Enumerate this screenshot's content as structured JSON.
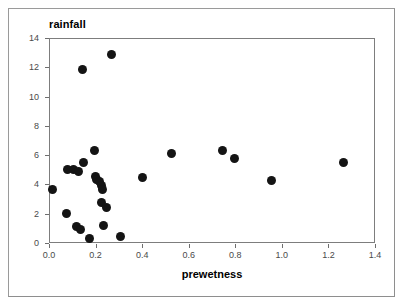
{
  "chart_data": {
    "type": "scatter",
    "title": "rainfall",
    "xlabel": "prewetness",
    "ylabel": "rainfall",
    "xlim": [
      0.0,
      1.4
    ],
    "ylim": [
      0,
      14
    ],
    "grid": false,
    "legend": null,
    "marker": {
      "shape": "circle",
      "filled": true,
      "color": "#141414",
      "size_px": 9
    },
    "xticks": [
      0.0,
      0.2,
      0.4,
      0.6,
      0.8,
      1.0,
      1.2,
      1.4
    ],
    "xtick_labels": [
      "0.0",
      "0.2",
      "0.4",
      "0.6",
      "0.8",
      "1.0",
      "1.2",
      "1.4"
    ],
    "yticks": [
      0,
      2,
      4,
      6,
      8,
      10,
      12,
      14
    ],
    "ytick_labels": [
      "0",
      "2",
      "4",
      "6",
      "8",
      "10",
      "12",
      "14"
    ],
    "points": [
      {
        "x": 0.015,
        "y": 3.65
      },
      {
        "x": 0.075,
        "y": 2.0
      },
      {
        "x": 0.08,
        "y": 5.05
      },
      {
        "x": 0.105,
        "y": 5.05
      },
      {
        "x": 0.12,
        "y": 1.1
      },
      {
        "x": 0.125,
        "y": 4.85
      },
      {
        "x": 0.135,
        "y": 0.9
      },
      {
        "x": 0.145,
        "y": 11.85
      },
      {
        "x": 0.15,
        "y": 5.5
      },
      {
        "x": 0.175,
        "y": 0.3
      },
      {
        "x": 0.195,
        "y": 6.3
      },
      {
        "x": 0.2,
        "y": 4.55
      },
      {
        "x": 0.205,
        "y": 4.35
      },
      {
        "x": 0.215,
        "y": 4.2
      },
      {
        "x": 0.225,
        "y": 3.95
      },
      {
        "x": 0.225,
        "y": 2.8
      },
      {
        "x": 0.23,
        "y": 3.65
      },
      {
        "x": 0.235,
        "y": 1.2
      },
      {
        "x": 0.245,
        "y": 2.45
      },
      {
        "x": 0.27,
        "y": 12.85
      },
      {
        "x": 0.305,
        "y": 0.45
      },
      {
        "x": 0.4,
        "y": 4.45
      },
      {
        "x": 0.525,
        "y": 6.1
      },
      {
        "x": 0.745,
        "y": 6.3
      },
      {
        "x": 0.795,
        "y": 5.75
      },
      {
        "x": 0.955,
        "y": 4.25
      },
      {
        "x": 1.265,
        "y": 5.5
      }
    ]
  },
  "figure": {
    "title_text": "rainfall",
    "xaxis_label_text": "prewetness"
  }
}
